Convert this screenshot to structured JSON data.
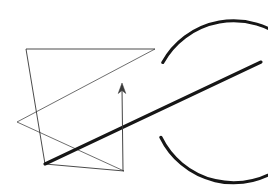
{
  "figure": {
    "title": "Geometric line figure with circle, chords and vector arrow",
    "background_color": "#ffffff",
    "canvas": {
      "width": 268,
      "height": 192
    },
    "stroke_colors": {
      "thick": "#161616",
      "thin": "#2b2b2b",
      "thin_soft": "#4a4a4a",
      "arrow": "#3a3a3a"
    },
    "stroke_widths": {
      "thick": 3.1,
      "thin": 0.85,
      "arrow": 0.95
    },
    "circle": {
      "label": "broken-circle",
      "center_x": 90,
      "center_y": 98,
      "radius": 81,
      "gap_start_deg": -26,
      "gap_end_deg": 29,
      "stroke": "#161616",
      "stroke_width": 3.1,
      "path": "M 162.8 134.2 A 81 81 0 1 1 162.0 59.4"
    },
    "thick_line": {
      "label": "secant-ray",
      "x1": 45,
      "y1": 164,
      "x2": 261,
      "y2": 62,
      "stroke": "#161616",
      "stroke_width": 3.1
    },
    "chords": [
      {
        "label": "top-horizontal-chord",
        "x1": 26,
        "y1": 49,
        "x2": 155,
        "y2": 49,
        "stroke": "#2b2b2b",
        "stroke_width": 0.85
      },
      {
        "label": "left-vertical-chord",
        "x1": 26,
        "y1": 49,
        "x2": 45,
        "y2": 164,
        "stroke": "#2b2b2b",
        "stroke_width": 0.85
      },
      {
        "label": "long-rising-chord",
        "x1": 17,
        "y1": 122,
        "x2": 155,
        "y2": 49,
        "stroke": "#4a4a4a",
        "stroke_width": 0.8
      },
      {
        "label": "lower-falling-chord",
        "x1": 17,
        "y1": 122,
        "x2": 124,
        "y2": 171,
        "stroke": "#4a4a4a",
        "stroke_width": 0.8
      },
      {
        "label": "base-chord",
        "x1": 45,
        "y1": 164,
        "x2": 124,
        "y2": 171,
        "stroke": "#2b2b2b",
        "stroke_width": 0.85
      }
    ],
    "arrow": {
      "label": "upward-vector-arrow",
      "x1": 123,
      "y1": 171,
      "x2": 122,
      "y2": 86,
      "direction": "up",
      "head_points": "122,83 118.2,93.5 122,90.5 125.8,93.5",
      "stroke": "#3a3a3a",
      "stroke_width": 0.95
    },
    "vertices": [
      {
        "label": "vertex-top-left",
        "x": 26,
        "y": 49
      },
      {
        "label": "vertex-top-right",
        "x": 155,
        "y": 49
      },
      {
        "label": "vertex-left-mid",
        "x": 17,
        "y": 122
      },
      {
        "label": "vertex-bottom-left",
        "x": 45,
        "y": 164
      },
      {
        "label": "vertex-bottom-right",
        "x": 124,
        "y": 171
      }
    ]
  }
}
